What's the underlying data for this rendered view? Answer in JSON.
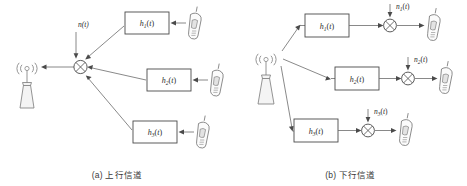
{
  "figure": {
    "background_color": "#ffffff",
    "line_color": "#6b6b6b",
    "text_color": "#2b2b2b"
  },
  "panels": [
    {
      "id": "uplink",
      "caption": "(a) 上行信道",
      "base_station_label": "base-station-tower",
      "noise": {
        "label": "n(t)",
        "var": "n",
        "sub": "",
        "arg": "(t)"
      },
      "summer_symbol": "⊕",
      "channels": [
        {
          "box_label": "h₁(t)",
          "var": "h",
          "sub": "1",
          "arg": "(t)",
          "device": "mobile-phone"
        },
        {
          "box_label": "h₂(t)",
          "var": "h",
          "sub": "2",
          "arg": "(t)",
          "device": "mobile-phone"
        },
        {
          "box_label": "h₃(t)",
          "var": "h",
          "sub": "3",
          "arg": "(t)",
          "device": "mobile-phone"
        }
      ]
    },
    {
      "id": "downlink",
      "caption": "(b) 下行信道",
      "base_station_label": "base-station-tower",
      "summer_symbol": "⊕",
      "channels": [
        {
          "box_label": "h₁(t)",
          "var": "h",
          "sub": "1",
          "arg": "(t)",
          "noise_label": "n₁(t)",
          "noise_var": "n",
          "noise_sub": "1",
          "noise_arg": "(t)",
          "device": "mobile-phone"
        },
        {
          "box_label": "h₂(t)",
          "var": "h",
          "sub": "2",
          "arg": "(t)",
          "noise_label": "n₂(t)",
          "noise_var": "n",
          "noise_sub": "2",
          "noise_arg": "(t)",
          "device": "mobile-phone"
        },
        {
          "box_label": "h₃(t)",
          "var": "h",
          "sub": "3",
          "arg": "(t)",
          "noise_label": "n₃(t)",
          "noise_var": "n",
          "noise_sub": "3",
          "noise_arg": "(t)",
          "device": "mobile-phone"
        }
      ]
    }
  ]
}
